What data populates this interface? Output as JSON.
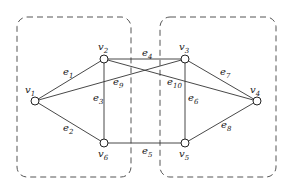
{
  "diagram": {
    "type": "graph",
    "groups": [
      {
        "id": "left-group",
        "x": 17,
        "y": 17,
        "w": 114,
        "h": 160
      },
      {
        "id": "right-group",
        "x": 160,
        "y": 17,
        "w": 116,
        "h": 160
      }
    ],
    "nodes": [
      {
        "id": "v1",
        "base": "v",
        "sub": "1",
        "x": 35,
        "y": 101,
        "lx": 25,
        "ly": 93
      },
      {
        "id": "v2",
        "base": "v",
        "sub": "2",
        "x": 104,
        "y": 59,
        "lx": 98,
        "ly": 50
      },
      {
        "id": "v3",
        "base": "v",
        "sub": "3",
        "x": 185,
        "y": 59,
        "lx": 179,
        "ly": 50
      },
      {
        "id": "v4",
        "base": "v",
        "sub": "4",
        "x": 257,
        "y": 101,
        "lx": 250,
        "ly": 93
      },
      {
        "id": "v5",
        "base": "v",
        "sub": "5",
        "x": 185,
        "y": 143,
        "lx": 179,
        "ly": 157
      },
      {
        "id": "v6",
        "base": "v",
        "sub": "6",
        "x": 104,
        "y": 143,
        "lx": 98,
        "ly": 157
      }
    ],
    "edges": [
      {
        "id": "e1",
        "base": "e",
        "sub": "1",
        "from": "v1",
        "to": "v2",
        "lx": 63,
        "ly": 75
      },
      {
        "id": "e2",
        "base": "e",
        "sub": "2",
        "from": "v1",
        "to": "v6",
        "lx": 63,
        "ly": 131
      },
      {
        "id": "e3",
        "base": "e",
        "sub": "3",
        "from": "v2",
        "to": "v6",
        "lx": 93,
        "ly": 101
      },
      {
        "id": "e4",
        "base": "e",
        "sub": "4",
        "from": "v2",
        "to": "v3",
        "lx": 142,
        "ly": 56
      },
      {
        "id": "e5",
        "base": "e",
        "sub": "5",
        "from": "v6",
        "to": "v5",
        "lx": 142,
        "ly": 154
      },
      {
        "id": "e6",
        "base": "e",
        "sub": "6",
        "from": "v3",
        "to": "v5",
        "lx": 188,
        "ly": 101
      },
      {
        "id": "e7",
        "base": "e",
        "sub": "7",
        "from": "v3",
        "to": "v4",
        "lx": 220,
        "ly": 75
      },
      {
        "id": "e8",
        "base": "e",
        "sub": "8",
        "from": "v5",
        "to": "v4",
        "lx": 221,
        "ly": 128
      },
      {
        "id": "e9",
        "base": "e",
        "sub": "9",
        "from": "v1",
        "to": "v3",
        "lx": 113,
        "ly": 85
      },
      {
        "id": "e10",
        "base": "e",
        "sub": "10",
        "from": "v2",
        "to": "v4",
        "lx": 167,
        "ly": 85
      }
    ]
  }
}
